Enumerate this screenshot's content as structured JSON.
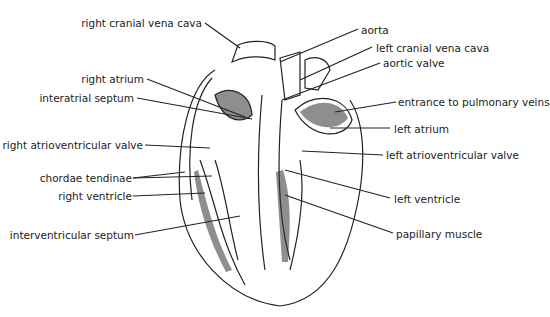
{
  "diagram": {
    "labels": {
      "right_cranial_vena_cava": "right cranial vena cava",
      "aorta": "aorta",
      "left_cranial_vena_cava": "left cranial vena cava",
      "aortic_valve": "aortic valve",
      "right_atrium": "right atrium",
      "interatrial_septum": "interatrial septum",
      "entrance_to_pulmonary_veins": "entrance to pulmonary veins",
      "left_atrium": "left atrium",
      "right_atrioventricular_valve": "right atrioventricular valve",
      "left_atrioventricular_valve": "left atrioventricular valve",
      "chordae_tendinae": "chordae tendinae",
      "right_ventricle": "right ventricle",
      "left_ventricle": "left ventricle",
      "interventricular_septum": "interventricular septum",
      "papillary_muscle": "papillary muscle"
    }
  }
}
